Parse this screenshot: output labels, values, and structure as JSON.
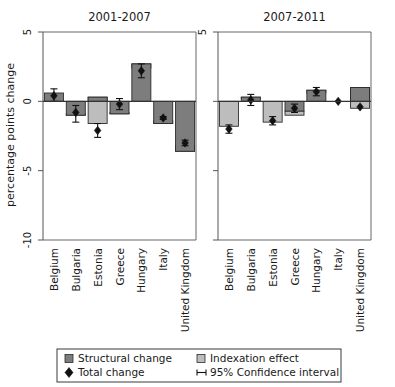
{
  "chart_data": {
    "type": "bar",
    "title": "",
    "ylabel": "percentage points change",
    "xlabel": "",
    "ylim": [
      -10,
      5
    ],
    "yticks": [
      5,
      0,
      -5,
      -10
    ],
    "ytick_labels": [
      "5",
      "0",
      "-5",
      "-10"
    ],
    "grid": false,
    "legend_position": "bottom",
    "categories": [
      "Belgium",
      "Bulgaria",
      "Estonia",
      "Greece",
      "Hungary",
      "Italy",
      "United Kingdom"
    ],
    "panels": [
      {
        "title": "2001-2007",
        "series": [
          {
            "name": "Structural change",
            "color": "#7d7d7d",
            "values": [
              0.6,
              -1.0,
              0.3,
              -0.9,
              2.7,
              -1.6,
              -3.6
            ]
          },
          {
            "name": "Indexation effect",
            "color": "#bdbdbd",
            "values": [
              0.0,
              0.1,
              -1.9,
              0.1,
              -0.3,
              0.2,
              0.4
            ]
          }
        ],
        "total_change": {
          "name": "Total change",
          "color": "#111111",
          "values": [
            0.4,
            -0.8,
            -2.1,
            -0.2,
            2.2,
            -1.2,
            -3.0
          ]
        },
        "confidence_interval": {
          "name": "95% Confidence interval",
          "level": "95%",
          "lower": [
            0.0,
            -1.5,
            -2.6,
            -0.6,
            1.7,
            -1.3,
            -3.2
          ],
          "upper": [
            0.9,
            -0.3,
            -1.6,
            0.2,
            2.7,
            -1.1,
            -2.8
          ]
        }
      },
      {
        "title": "2007-2011",
        "series": [
          {
            "name": "Structural change",
            "color": "#7d7d7d",
            "values": [
              0.0,
              0.3,
              0.0,
              -0.7,
              0.8,
              0.0,
              1.0
            ]
          },
          {
            "name": "Indexation effect",
            "color": "#bdbdbd",
            "values": [
              -1.8,
              -0.1,
              -1.5,
              -0.3,
              -0.2,
              0.0,
              -1.5
            ]
          }
        ],
        "total_change": {
          "name": "Total change",
          "color": "#111111",
          "values": [
            -2.0,
            0.1,
            -1.4,
            -0.5,
            0.7,
            0.0,
            -0.4
          ]
        },
        "confidence_interval": {
          "name": "95% Confidence interval",
          "level": "95%",
          "lower": [
            -2.3,
            -0.3,
            -1.7,
            -0.8,
            0.4,
            0.0,
            -0.4
          ],
          "upper": [
            -1.7,
            0.5,
            -1.1,
            -0.2,
            1.0,
            0.0,
            -0.4
          ]
        }
      }
    ],
    "legend": [
      {
        "label": "Structural change",
        "marker": "square",
        "color": "#7d7d7d"
      },
      {
        "label": "Indexation effect",
        "marker": "square",
        "color": "#bdbdbd"
      },
      {
        "label": "Total change",
        "marker": "diamond",
        "color": "#111111"
      },
      {
        "label": "95% Confidence interval",
        "marker": "errorbar",
        "color": "#111111"
      }
    ]
  }
}
